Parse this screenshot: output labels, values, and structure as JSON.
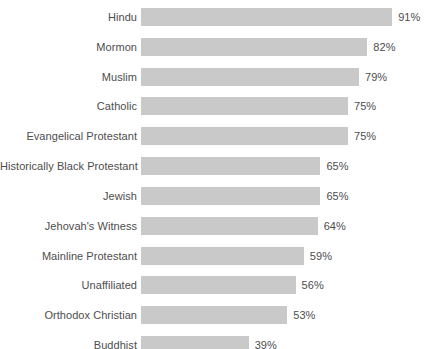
{
  "chart_data": {
    "type": "bar",
    "orientation": "horizontal",
    "title": "",
    "subtitle": "",
    "xlabel": "",
    "ylabel": "",
    "xlim": [
      0,
      100
    ],
    "grid": false,
    "legend": null,
    "value_suffix": "%",
    "bar_color": "#c9c9c9",
    "text_color": "#4d4d4d",
    "background": "#ffffff",
    "categories": [
      "Hindu",
      "Mormon",
      "Muslim",
      "Catholic",
      "Evangelical Protestant",
      "Historically Black Protestant",
      "Jewish",
      "Jehovah's Witness",
      "Mainline Protestant",
      "Unaffiliated",
      "Orthodox Christian",
      "Buddhist"
    ],
    "values": [
      91,
      82,
      79,
      75,
      75,
      65,
      65,
      64,
      59,
      56,
      53,
      39
    ],
    "value_labels": [
      "91%",
      "82%",
      "79%",
      "75%",
      "75%",
      "65%",
      "65%",
      "64%",
      "59%",
      "56%",
      "53%",
      "39%"
    ]
  }
}
